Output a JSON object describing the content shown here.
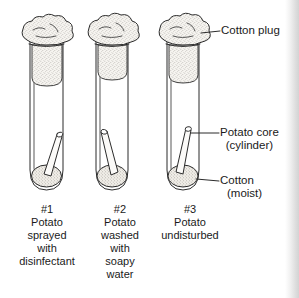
{
  "figure": {
    "ink_color": "#2b2b2b",
    "background_color": "#ffffff",
    "cotton_fill_color": "#f4f2ee"
  },
  "callouts": [
    {
      "id": "cotton-plug",
      "line1": "Cotton plug",
      "line2": ""
    },
    {
      "id": "potato-core",
      "line1": "Potato core",
      "line2": "(cylinder)"
    },
    {
      "id": "cotton-moist",
      "line1": "Cotton",
      "line2": "(moist)"
    }
  ],
  "tubes": [
    {
      "id": "tube-1",
      "number": "#1",
      "lines": [
        "Potato",
        "sprayed",
        "with",
        "disinfectant"
      ]
    },
    {
      "id": "tube-2",
      "number": "#2",
      "lines": [
        "Potato",
        "washed",
        "with",
        "soapy",
        "water"
      ]
    },
    {
      "id": "tube-3",
      "number": "#3",
      "lines": [
        "Potato",
        "undisturbed"
      ]
    }
  ]
}
